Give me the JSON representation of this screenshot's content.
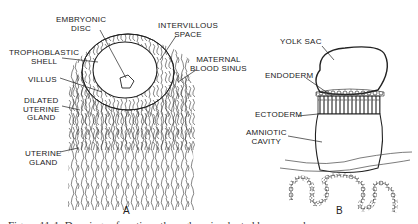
{
  "panel_a": {
    "letter": "A",
    "labels": {
      "embryonic_disc": "EMBRYONIC\nDISC",
      "intervillous_space": "INTERVILLOUS\nSPACE",
      "trophoblastic_shell": "TROPHOBLASTIC\nSHELL",
      "maternal_blood_sinus": "MATERNAL\nBLOOD SINUS",
      "villus": "VILLUS",
      "dilated_uterine_gland": "DILATED\nUTERINE\nGLAND",
      "uterine_gland": "UTERINE\nGLAND"
    }
  },
  "panel_b": {
    "letter": "B",
    "labels": {
      "yolk_sac": "YOLK SAC",
      "endoderm": "ENDODERM",
      "ectoderm": "ECTODERM",
      "amniotic_cavity": "AMNIOTIC\nCAVITY"
    }
  },
  "caption": "Figure 11-1.  Drawings of sections through an implanted human embryo"
}
